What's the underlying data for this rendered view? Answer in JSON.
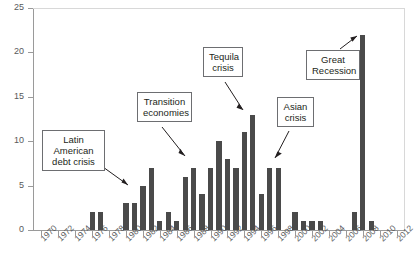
{
  "chart_data": {
    "type": "bar",
    "title": "",
    "xlabel": "",
    "ylabel": "",
    "ylim": [
      0,
      25
    ],
    "yticks": [
      0,
      5,
      10,
      15,
      20,
      25
    ],
    "xlim": [
      1969,
      2013
    ],
    "xticks": [
      1970,
      1972,
      1974,
      1976,
      1978,
      1980,
      1982,
      1984,
      1986,
      1988,
      1990,
      1992,
      1994,
      1996,
      1998,
      2000,
      2002,
      2004,
      2006,
      2008,
      2010,
      2012
    ],
    "xtick_labels": [
      "1970",
      "1972",
      "1974",
      "1976",
      "1978",
      "1980",
      "1982",
      "1984",
      "1986",
      "1988",
      "1990",
      "1992",
      "1994",
      "1996",
      "1998",
      "2000",
      "2002",
      "2004",
      "2006",
      "2008",
      "2010",
      "2012"
    ],
    "grid": false,
    "legend": false,
    "bar_color": "#4a4a4a",
    "axis_color": "#9a9a9a",
    "categories": [
      1970,
      1971,
      1972,
      1973,
      1974,
      1975,
      1976,
      1977,
      1978,
      1979,
      1980,
      1981,
      1982,
      1983,
      1984,
      1985,
      1986,
      1987,
      1988,
      1989,
      1990,
      1991,
      1992,
      1993,
      1994,
      1995,
      1996,
      1997,
      1998,
      1999,
      2000,
      2001,
      2002,
      2003,
      2004,
      2005,
      2006,
      2007,
      2008,
      2009,
      2010,
      2011,
      2012
    ],
    "values": [
      0,
      0,
      0,
      0,
      0,
      0,
      2,
      2,
      0,
      0,
      3,
      3,
      5,
      7,
      1,
      2,
      1,
      6,
      7,
      4,
      7,
      10,
      8,
      7,
      11,
      13,
      4,
      7,
      7,
      0,
      2,
      1,
      1,
      1,
      0,
      0,
      0,
      2,
      22,
      1,
      0,
      0,
      0
    ],
    "annotations": [
      {
        "id": "latin-american-debt-crisis",
        "text": "Latin American\ndebt crisis",
        "target_year": 1982,
        "target_value": 5
      },
      {
        "id": "transition-economies",
        "text": "Transition\neconomies",
        "target_year": 1990,
        "target_value": 7
      },
      {
        "id": "tequila-crisis",
        "text": "Tequila\ncrisis",
        "target_year": 1995,
        "target_value": 13
      },
      {
        "id": "asian-crisis",
        "text": "Asian\ncrisis",
        "target_year": 1998,
        "target_value": 7
      },
      {
        "id": "great-recession",
        "text": "Great\nRecession",
        "target_year": 2008,
        "target_value": 22
      }
    ]
  },
  "axes": {
    "y_labels": [
      "0",
      "5",
      "10",
      "15",
      "20",
      "25"
    ],
    "x_labels": [
      "1970",
      "1972",
      "1974",
      "1976",
      "1978",
      "1980",
      "1982",
      "1984",
      "1986",
      "1988",
      "1990",
      "1992",
      "1994",
      "1996",
      "1998",
      "2000",
      "2002",
      "2004",
      "2006",
      "2008",
      "2010",
      "2012"
    ]
  },
  "callouts": {
    "latin": "Latin American\ndebt crisis",
    "transition": "Transition\neconomies",
    "tequila": "Tequila\ncrisis",
    "asian": "Asian\ncrisis",
    "recession": "Great\nRecession"
  }
}
